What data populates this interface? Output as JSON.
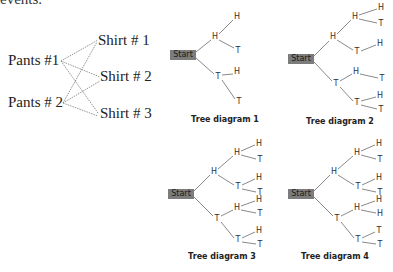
{
  "header_clipped_text": "events.",
  "matching_diagram": {
    "pants": [
      "Pants #1",
      "Pants # 2"
    ],
    "shirts": [
      "Shirt # 1",
      "Shirt # 2",
      "Shirt # 3"
    ]
  },
  "trees": [
    {
      "caption": "Tree diagram 1",
      "start_label": "Start",
      "level1": [
        "H",
        "T"
      ],
      "level2": [
        "H",
        "T",
        "H",
        "T"
      ],
      "level3": []
    },
    {
      "caption": "Tree diagram 2",
      "start_label": "Start",
      "level1": [
        "H",
        "T"
      ],
      "level2": [
        "H",
        "T",
        "H",
        "T"
      ],
      "level3": [
        "H",
        "T",
        "H",
        "T",
        "H",
        "T"
      ]
    },
    {
      "caption": "Tree diagram 3",
      "start_label": "Start",
      "level1": [
        "H",
        "T"
      ],
      "level2": [
        "H",
        "T",
        "H",
        "T"
      ],
      "level3": [
        "H",
        "T",
        "H",
        "T",
        "H",
        "T",
        "H",
        "T"
      ]
    },
    {
      "caption": "Tree diagram 4",
      "start_label": "Start",
      "level1": [
        "H",
        "T"
      ],
      "level2": [
        "H",
        "T",
        "H",
        "T"
      ],
      "level3": [
        "H",
        "T",
        "H",
        "T",
        "H",
        "H",
        "T",
        "T"
      ]
    }
  ]
}
